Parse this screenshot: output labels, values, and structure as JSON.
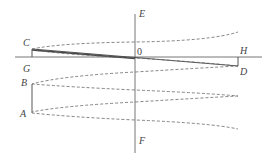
{
  "diagram": {
    "labels": {
      "C": "C",
      "G": "G",
      "B": "B",
      "A": "A",
      "E": "E",
      "F": "F",
      "O": "0",
      "H": "H",
      "D": "D"
    },
    "colors": {
      "background": "#ffffff",
      "line": "#555555",
      "text": "#444444"
    }
  }
}
